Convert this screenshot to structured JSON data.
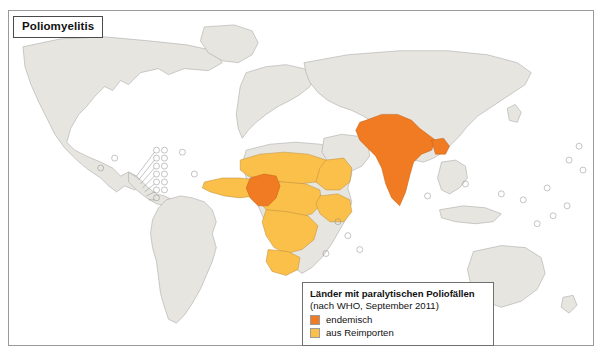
{
  "figure": {
    "title": "Poliomyelitis"
  },
  "legend": {
    "title": "Länder mit paralytischen Poliofällen",
    "subtitle": "(nach WHO, September 2011)",
    "items": [
      {
        "label": "endemisch",
        "color": "#F07B22",
        "key": "endemic"
      },
      {
        "label": "aus Reimporten",
        "color": "#FBC04A",
        "key": "reimport"
      }
    ]
  },
  "colors": {
    "land": "#e7e5df",
    "land_stroke": "#9d9d9d",
    "ocean": "#ffffff",
    "coast_stroke": "#b9c3cf",
    "endemic": "#F07B22",
    "reimport": "#FBC04A",
    "frame": "#9a9a9a",
    "text": "#111111"
  },
  "map": {
    "projection": "world-equirectangular",
    "endemic_countries": [
      "Nigeria",
      "Afghanistan",
      "Pakistan",
      "India"
    ],
    "reimport_countries": [
      "Guinea",
      "Sierra Leone",
      "Liberia",
      "Côte d'Ivoire",
      "Ghana",
      "Togo",
      "Benin",
      "Burkina Faso",
      "Mali",
      "Niger",
      "Chad",
      "Sudan",
      "South Sudan",
      "Cameroon",
      "Central African Republic",
      "Gabon",
      "Republic of the Congo",
      "Democratic Republic of the Congo",
      "Angola",
      "Uganda",
      "Kenya",
      "Somalia"
    ]
  }
}
